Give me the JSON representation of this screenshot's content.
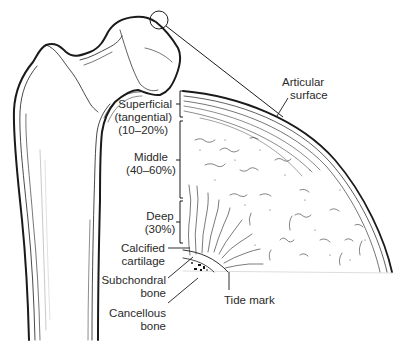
{
  "figure": {
    "labels": {
      "articular": {
        "line1": "Articular",
        "line2": "surface"
      },
      "superficial": {
        "line1": "Superficial",
        "line2": "(tangential)",
        "line3": "(10–20%)"
      },
      "middle": {
        "line1": "Middle",
        "line2": "(40–60%)"
      },
      "deep": {
        "line1": "Deep",
        "line2": "(30%)"
      },
      "calcified": {
        "line1": "Calcified",
        "line2": "cartilage"
      },
      "subchondral": {
        "line1": "Subchondral",
        "line2": "bone"
      },
      "cancellous": {
        "line1": "Cancellous",
        "line2": "bone"
      },
      "tidemark": {
        "line1": "Tide mark"
      }
    },
    "colors": {
      "ink": "#1a1a1a",
      "background": "#ffffff"
    }
  }
}
